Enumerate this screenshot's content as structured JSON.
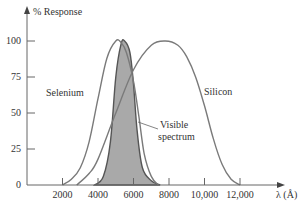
{
  "chart_data": {
    "type": "line",
    "title": "",
    "xlabel": "λ (Å)",
    "ylabel": "% Response",
    "xlim": [
      0,
      14000
    ],
    "ylim": [
      0,
      110
    ],
    "x_ticks": [
      2000,
      4000,
      6000,
      8000,
      10000,
      12000
    ],
    "x_tick_labels": [
      "2000",
      "4000",
      "6000",
      "8000",
      "10,000",
      "12,000"
    ],
    "y_ticks": [
      0,
      25,
      50,
      75,
      100
    ],
    "y_tick_labels": [
      "0",
      "25",
      "50",
      "75",
      "100"
    ],
    "grid": false,
    "legend": "inline labels",
    "series": [
      {
        "name": "Selenium",
        "x": [
          2000,
          2500,
          3000,
          3500,
          4000,
          4500,
          5000,
          5300,
          5600,
          6000,
          6300,
          6600,
          7000,
          7400
        ],
        "y": [
          0,
          4,
          12,
          30,
          60,
          88,
          100,
          99,
          92,
          72,
          48,
          22,
          6,
          0
        ],
        "color": "#777777"
      },
      {
        "name": "Silicon",
        "x": [
          2800,
          3500,
          4000,
          5000,
          6000,
          7000,
          7800,
          8500,
          9000,
          9500,
          10000,
          10500,
          11000,
          11500,
          12000
        ],
        "y": [
          0,
          8,
          18,
          50,
          80,
          97,
          100,
          97,
          89,
          75,
          55,
          32,
          14,
          4,
          0
        ],
        "color": "#777777"
      },
      {
        "name": "Visible spectrum",
        "x": [
          3800,
          4300,
          4700,
          5000,
          5300,
          5500,
          5800,
          6000,
          6200,
          6500,
          7000,
          7500
        ],
        "y": [
          0,
          6,
          30,
          75,
          98,
          100,
          92,
          70,
          38,
          12,
          3,
          0
        ],
        "color": "#555555",
        "fill": "#a9a9a9"
      }
    ],
    "annotations": [
      {
        "text": "Selenium",
        "x": 3000,
        "y": 63
      },
      {
        "text": "Silicon",
        "x": 10400,
        "y": 65
      },
      {
        "text": "Visible spectrum",
        "x": 7400,
        "y": 40
      }
    ]
  },
  "labels": {
    "ylabel": "% Response",
    "xlabel": "λ (Å)",
    "selenium": "Selenium",
    "silicon": "Silicon",
    "visible_1": "Visible",
    "visible_2": "spectrum",
    "yt0": "0",
    "yt25": "25",
    "yt50": "50",
    "yt75": "75",
    "yt100": "100",
    "xt2000": "2000",
    "xt4000": "4000",
    "xt6000": "6000",
    "xt8000": "8000",
    "xt10000": "10,000",
    "xt12000": "12,000"
  }
}
